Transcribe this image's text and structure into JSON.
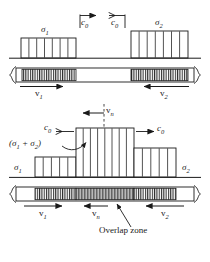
{
  "figure": {
    "title": "",
    "labels": {
      "sigma1_top": "σ1",
      "sigma2_top": "σ2",
      "c0_top_left": "c0",
      "c0_top_right": "c0",
      "v1_top": "v1",
      "v2_top": "v2",
      "vn_mid": "vn",
      "c0_mid_left": "c0",
      "c0_mid_right": "c0",
      "sigma_sum": "(σ1 + σ2)",
      "sigma1_bottom": "σ1",
      "sigma2_bottom": "σ2",
      "v1_bottom": "v1",
      "vn_bottom": "vn",
      "v2_bottom": "v2",
      "overlap_zone": "Overlap zone"
    },
    "symbol_parts": {
      "sigma1_base": "σ",
      "sigma1_sub": "1",
      "sigma2_base": "σ",
      "sigma2_sub": "2",
      "c_base": "c",
      "c_sub": "0",
      "v_base": "v",
      "v1_sub": "1",
      "v2_sub": "2",
      "vn_sub": "n",
      "sum_open": "(σ",
      "sum_one": "1",
      "sum_plus": " + σ",
      "sum_two": "2",
      "sum_close": ")"
    },
    "colors": {
      "line": "#1a1a1a",
      "background": "#ffffff",
      "hatch": "#333333",
      "overlap_fill": "#9a9a9a"
    },
    "panels": [
      {
        "name": "before-collision",
        "description": "Two stress pulses sigma1 and sigma2 travelling toward each other at wave speed c0 in a rod; particle velocities v1 and v2.",
        "pulse_left": {
          "label": "σ1",
          "bar_count": 7,
          "height_units": 1.0,
          "direction": "right"
        },
        "pulse_right": {
          "label": "σ2",
          "bar_count": 7,
          "height_units": 1.35,
          "direction": "left"
        }
      },
      {
        "name": "during-overlap",
        "description": "Pulses superposed: central region has amplitude (sigma1 + sigma2); net particle velocity vn; overlap zone marked in the rod.",
        "steps": [
          {
            "label": "σ1",
            "bar_count": 5,
            "height_units": 0.55
          },
          {
            "label": "(σ1 + σ2)",
            "bar_count": 8,
            "height_units": 1.55
          },
          {
            "label": "σ2",
            "bar_count": 5,
            "height_units": 0.9
          }
        ]
      }
    ]
  }
}
